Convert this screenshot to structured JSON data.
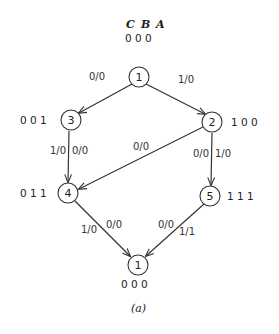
{
  "diagram": {
    "header": {
      "vars": [
        "C",
        "B",
        "A"
      ],
      "bits": "0 0 0"
    },
    "nodes": [
      {
        "id": "n1_top",
        "label": "1",
        "bits": ""
      },
      {
        "id": "n3",
        "label": "3",
        "bits": "0 0 1"
      },
      {
        "id": "n2",
        "label": "2",
        "bits": "1 0 0"
      },
      {
        "id": "n4",
        "label": "4",
        "bits": "0 1 1"
      },
      {
        "id": "n5",
        "label": "5",
        "bits": "1 1 1"
      },
      {
        "id": "n1_bottom",
        "label": "1",
        "bits": "0 0 0"
      }
    ],
    "edges": [
      {
        "from": "1",
        "to": "3",
        "labels": [
          "0/0"
        ]
      },
      {
        "from": "1",
        "to": "2",
        "labels": [
          "1/0"
        ]
      },
      {
        "from": "3",
        "to": "4",
        "labels": [
          "1/0",
          "0/0"
        ]
      },
      {
        "from": "2",
        "to": "4",
        "labels": [
          "0/0"
        ]
      },
      {
        "from": "2",
        "to": "5",
        "labels": [
          "0/0",
          "1/0"
        ]
      },
      {
        "from": "4",
        "to": "1",
        "labels": [
          "1/0",
          "0/0"
        ]
      },
      {
        "from": "5",
        "to": "1",
        "labels": [
          "0/0",
          "1/1"
        ]
      }
    ],
    "caption": "(a)",
    "colors": {
      "stroke": "#333333",
      "background": "#ffffff"
    }
  }
}
